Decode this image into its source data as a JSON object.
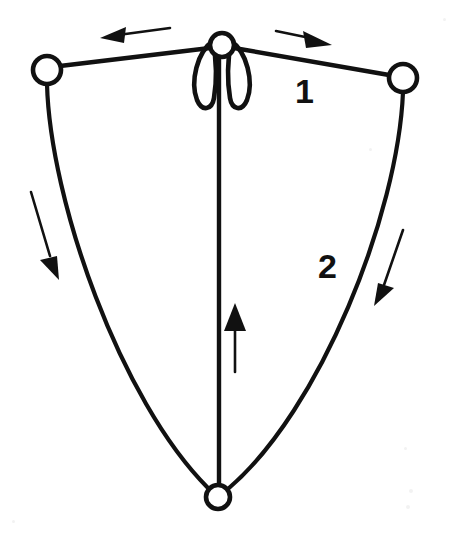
{
  "figure": {
    "background_color": "#ffffff",
    "ink_color": "#111111",
    "width": 450,
    "height": 537
  },
  "labels": [
    {
      "name": "label-1",
      "text": "1",
      "x": 295,
      "y": 103
    },
    {
      "name": "label-2",
      "text": "2",
      "x": 318,
      "y": 278
    }
  ],
  "nodes": [
    {
      "name": "node-pivot-top",
      "label": "top pivot joint",
      "cx": 222,
      "cy": 45,
      "r": 12
    },
    {
      "name": "node-left",
      "label": "left end mass",
      "cx": 47,
      "cy": 70,
      "r": 14
    },
    {
      "name": "node-right",
      "label": "right end mass",
      "cx": 403,
      "cy": 78,
      "r": 14
    },
    {
      "name": "node-bottom",
      "label": "bottom mass",
      "cx": 218,
      "cy": 497,
      "r": 12
    }
  ],
  "segments": [
    {
      "name": "link-top-left",
      "label": "upper link to left mass",
      "path": "M 60 66 L 210 48",
      "width": 4.4
    },
    {
      "name": "link-top-right",
      "label": "upper link to right mass",
      "path": "M 234 48 L 389 75",
      "width": 4.4
    },
    {
      "name": "arc-left-sweep",
      "label": "left swing trajectory arc",
      "path": "M 47 84 C 50 200 120 400 208 488",
      "width": 4.2
    },
    {
      "name": "arc-right-sweep",
      "label": "right swing trajectory arc",
      "path": "M 403 92 C 398 215 320 410 229 488",
      "width": 4.2
    },
    {
      "name": "spine-vertical",
      "label": "central vertical rod",
      "path": "M 219 56 L 219 486",
      "width": 4.4
    }
  ],
  "petals": [
    {
      "name": "petal-loop-left",
      "label": "left narrow oscillation loop",
      "path": "M 213 41 C 197 52 190 82 197 100 C 202 112 212 110 214 98 C 217 80 216 58 213 41 Z"
    },
    {
      "name": "petal-loop-right",
      "label": "right narrow oscillation loop",
      "path": "M 231 41 C 247 52 254 82 247 100 C 242 112 232 110 230 98 C 227 80 228 58 231 41 Z"
    }
  ],
  "arrows": [
    {
      "name": "arrow-top-left",
      "label": "leftward motion arrow",
      "direction": "left",
      "shaft": "M 170 28 L 118 35",
      "head": "M 100 38 L 126 27 L 124 43 Z"
    },
    {
      "name": "arrow-top-right",
      "label": "rightward motion arrow",
      "direction": "right",
      "shaft": "M 276 31 L 310 38",
      "head": "M 332 45 L 303 31 L 306 48 Z"
    },
    {
      "name": "arrow-left-down",
      "label": "left downward swing arrow",
      "direction": "down-right",
      "shaft": "M 31 192 L 50 256",
      "head": "M 59 280 L 40 260 L 57 256 Z"
    },
    {
      "name": "arrow-right-down",
      "label": "right downward swing arrow",
      "direction": "down-left",
      "shaft": "M 403 230 L 384 285",
      "head": "M 374 306 L 394 288 L 378 283 Z"
    },
    {
      "name": "arrow-center-up",
      "label": "central upward arrow",
      "direction": "up",
      "shaft": "M 235 372 L 235 325",
      "head": "M 235 303 L 246 331 L 224 331 Z"
    }
  ]
}
